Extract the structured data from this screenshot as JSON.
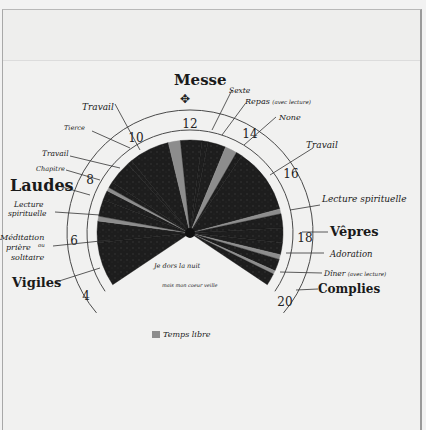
{
  "chart_data": {
    "type": "pie",
    "title": "Messe",
    "clock": {
      "hour_labels": [
        "4",
        "6",
        "8",
        "10",
        "12",
        "14",
        "16",
        "18",
        "20"
      ],
      "hours_per_turn": 24,
      "top_hour": 12
    },
    "segments": [
      {
        "label": "Vigiles",
        "start": 3.75,
        "end": 5.6,
        "kind": "office"
      },
      {
        "label": "Méditation ou prière solitaire",
        "start": 5.6,
        "end": 6.5,
        "kind": "activity"
      },
      {
        "label": "Temps libre",
        "start": 6.5,
        "end": 6.7,
        "kind": "free"
      },
      {
        "label": "Lecture spirituelle",
        "start": 6.7,
        "end": 7.4,
        "kind": "activity"
      },
      {
        "label": "Laudes",
        "start": 7.4,
        "end": 7.8,
        "kind": "office"
      },
      {
        "label": "Temps libre",
        "start": 7.8,
        "end": 7.95,
        "kind": "free"
      },
      {
        "label": "Chapitre",
        "start": 7.95,
        "end": 8.2,
        "kind": "activity"
      },
      {
        "label": "Travail",
        "start": 8.2,
        "end": 9.2,
        "kind": "work"
      },
      {
        "label": "Tierce",
        "start": 9.2,
        "end": 9.4,
        "kind": "office"
      },
      {
        "label": "Travail",
        "start": 9.4,
        "end": 11.1,
        "kind": "work"
      },
      {
        "label": "Temps libre",
        "start": 11.1,
        "end": 11.6,
        "kind": "free"
      },
      {
        "label": "Messe",
        "start": 11.6,
        "end": 12.5,
        "kind": "office"
      },
      {
        "label": "Sexte",
        "start": 12.5,
        "end": 12.75,
        "kind": "office"
      },
      {
        "label": "Repas (avec lecture)",
        "start": 12.75,
        "end": 13.5,
        "kind": "meal"
      },
      {
        "label": "Temps libre",
        "start": 13.5,
        "end": 14.0,
        "kind": "free"
      },
      {
        "label": "None",
        "start": 14.0,
        "end": 14.25,
        "kind": "office"
      },
      {
        "label": "Travail",
        "start": 14.25,
        "end": 17.0,
        "kind": "work"
      },
      {
        "label": "Temps libre",
        "start": 17.0,
        "end": 17.2,
        "kind": "free"
      },
      {
        "label": "Lecture spirituelle",
        "start": 17.2,
        "end": 17.8,
        "kind": "activity"
      },
      {
        "label": "Vêpres",
        "start": 17.8,
        "end": 18.4,
        "kind": "office"
      },
      {
        "label": "Adoration",
        "start": 18.4,
        "end": 18.9,
        "kind": "activity"
      },
      {
        "label": "Temps libre",
        "start": 18.9,
        "end": 19.1,
        "kind": "free"
      },
      {
        "label": "Dîner (avec lecture)",
        "start": 19.1,
        "end": 19.6,
        "kind": "meal"
      },
      {
        "label": "Temps libre",
        "start": 19.6,
        "end": 19.75,
        "kind": "free"
      },
      {
        "label": "Complies",
        "start": 19.75,
        "end": 20.25,
        "kind": "office"
      }
    ],
    "legend": [
      {
        "label": "Temps libre",
        "color": "#8d8d8d"
      }
    ],
    "annotations": [
      "Je dors la nuit",
      "mais mon coeur veille"
    ]
  },
  "labels": {
    "title": "Messe",
    "sexte": "Sexte",
    "repas": "Repas",
    "repas_note": "(avec lecture)",
    "none": "None",
    "travail_pm": "Travail",
    "lecture_pm": "Lecture spirituelle",
    "vepres": "Vêpres",
    "adoration": "Adoration",
    "diner": "Dîner",
    "diner_note": "(avec lecture)",
    "complies": "Complies",
    "travail_am": "Travail",
    "tierce": "Tierce",
    "travail_early": "Travail",
    "chapitre": "Chapitre",
    "laudes": "Laudes",
    "lecture_am_1": "Lecture",
    "lecture_am_2": "spirituelle",
    "meditation_1": "Méditation",
    "meditation_ou": "ou",
    "meditation_2": "prière",
    "meditation_3": "solitaire",
    "vigiles": "Vigiles",
    "night_1": "Je dors la nuit",
    "night_2": "mais mon coeur veille"
  },
  "hours": {
    "h4": "4",
    "h6": "6",
    "h8": "8",
    "h10": "10",
    "h12": "12",
    "h14": "14",
    "h16": "16",
    "h18": "18",
    "h20": "20"
  },
  "legend": {
    "label": "Temps libre"
  },
  "colors": {
    "dark": "#1c1c1c",
    "free": "#8d8d8d",
    "ring": "#4a4a4a",
    "paper": "#f1f1f0"
  }
}
